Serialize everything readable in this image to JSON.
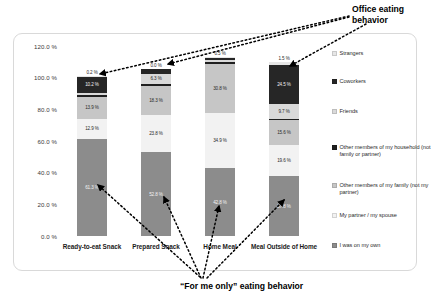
{
  "chart_data": {
    "type": "bar",
    "subtype": "stacked-100-percent-column",
    "title": "",
    "xlabel": "",
    "ylabel": "",
    "ylim": [
      0,
      120
    ],
    "ytick_labels": [
      "120.0 %",
      "100.0 %",
      "80.0 %",
      "60.0 %",
      "40.0 %",
      "20.0 %",
      "0.0 %"
    ],
    "ytick_values": [
      120,
      100,
      80,
      60,
      40,
      20,
      0
    ],
    "grid": false,
    "legend_position": "right",
    "categories": [
      "Ready-to-eat Snack",
      "Prepared Snack",
      "Home Meal",
      "Meal Outside of Home"
    ],
    "series": [
      {
        "name": "I was on my own",
        "color": "#8c8c8c",
        "values": [
          61.3,
          52.8,
          42.8,
          37.8
        ],
        "labels": [
          "61.3 %",
          "52.8 %",
          "42.8 %",
          "37.8 %"
        ]
      },
      {
        "name": "My partner / my spouse",
        "color": "#f2f2f2",
        "values": [
          12.9,
          23.8,
          34.9,
          19.6
        ],
        "labels": [
          "12.9 %",
          "23.8 %",
          "34.9 %",
          "19.6 %"
        ]
      },
      {
        "name": "Other members of my family (not my partner)",
        "color": "#c6c6c6",
        "values": [
          13.9,
          18.3,
          30.8,
          15.6
        ],
        "labels": [
          "13.9 %",
          "18.3 %",
          "30.8 %",
          "15.6 %"
        ]
      },
      {
        "name": "Other members of my household (not family or partner)",
        "color": "#1f1f1f",
        "values": [
          1.2,
          1.4,
          1.1,
          1.0
        ],
        "labels": [
          "1.2 %",
          "1.4 %",
          "1.1 %",
          "1.0 %"
        ]
      },
      {
        "name": "Friends",
        "color": "#d9d9d9",
        "values": [
          1.1,
          6.3,
          1.4,
          9.7
        ],
        "labels": [
          "1.1 %",
          "6.3 %",
          "1.4 %",
          "9.7 %"
        ]
      },
      {
        "name": "Coworkers",
        "color": "#262626",
        "values": [
          10.2,
          3.0,
          1.3,
          24.5
        ],
        "labels": [
          "10.2 %",
          "3.0 %",
          "1.3 %",
          "24.5 %"
        ]
      },
      {
        "name": "Strangers",
        "color": "#e6e6e6",
        "values": [
          0.2,
          0.0,
          0.5,
          1.5
        ],
        "labels": [
          "0.2 %",
          "0.0 %",
          "0.5 %",
          "1.5 %"
        ]
      }
    ]
  },
  "legend": {
    "items": [
      {
        "label": "Strangers",
        "color": "#e6e6e6"
      },
      {
        "label": "Coworkers",
        "color": "#262626"
      },
      {
        "label": "Friends",
        "color": "#d9d9d9"
      },
      {
        "label": "Other members of my household (not family or partner)",
        "color": "#1f1f1f"
      },
      {
        "label": "Other members of my family (not my partner)",
        "color": "#c6c6c6"
      },
      {
        "label": "My partner / my spouse",
        "color": "#f2f2f2"
      },
      {
        "label": "I was on my own",
        "color": "#8c8c8c"
      }
    ]
  },
  "annotations": {
    "office": "Office eating\nbehavior",
    "for_me_only": "“For me only” eating behavior"
  }
}
